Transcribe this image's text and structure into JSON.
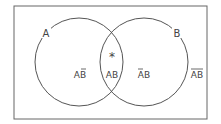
{
  "diagram": {
    "type": "venn",
    "sets": [
      {
        "name": "A",
        "label": "A"
      },
      {
        "name": "B",
        "label": "B"
      }
    ],
    "regions": {
      "a_not_b": {
        "base": "AB",
        "overline": "B"
      },
      "a_and_b": {
        "text": "AB"
      },
      "not_a_b": {
        "base": "AB",
        "overline": "A"
      },
      "not_a_not_b": {
        "base": "AB",
        "overline": "AB"
      }
    },
    "marker": "*",
    "colors": {
      "stroke": "#555555",
      "text": "#444444",
      "background": "#ffffff"
    }
  }
}
